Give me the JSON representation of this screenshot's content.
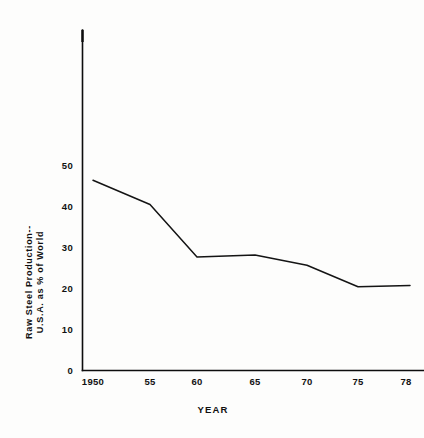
{
  "chart_data": {
    "type": "line",
    "title": "",
    "subtitle": "",
    "xlabel": "YEAR",
    "ylabel_line1": "Raw Steel Production--",
    "ylabel_line2": "U.S.A. as % of World",
    "ylabel": "Raw Steel Production-- U.S.A. as % of World",
    "x": [
      1950,
      1955,
      1960,
      1965,
      1970,
      1975,
      1978
    ],
    "categories": [
      "1950",
      "55",
      "60",
      "65",
      "70",
      "75",
      "78"
    ],
    "values": [
      47,
      41,
      28,
      28.5,
      26,
      20.7,
      21
    ],
    "series": [
      {
        "name": "Raw Steel Production U.S.A. as % of World",
        "values": [
          47,
          41,
          28,
          28.5,
          26,
          20.7,
          21
        ]
      }
    ],
    "xtick_labels": [
      "1950",
      "55",
      "60",
      "65",
      "70",
      "75",
      "78"
    ],
    "ytick_labels": [
      "0",
      "10",
      "20",
      "30",
      "40",
      "50"
    ],
    "ytick_values": [
      0,
      10,
      20,
      30,
      40,
      50
    ],
    "xlim": [
      1950,
      1978
    ],
    "ylim": [
      0,
      72
    ],
    "grid": false,
    "legend": false,
    "legend_position": "none",
    "line_color": "#141414",
    "axis_color": "#0d0d0d",
    "background_color": "#fdfdfc",
    "annotations": []
  }
}
